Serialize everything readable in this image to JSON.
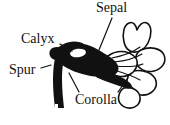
{
  "figure": {
    "kind": "botanical-line-drawing",
    "ink_color": "#111111",
    "background_color": "#ffffff",
    "labels": [
      {
        "id": "sepal",
        "text": "Sepal",
        "leader": "diagonal line down-left to sepal base"
      },
      {
        "id": "calyx",
        "text": "Calyx",
        "leader": "short line down-right to dark calyx mass"
      },
      {
        "id": "spur",
        "text": "Spur",
        "leader": "short line right to base of thick spur"
      },
      {
        "id": "corolla",
        "text": "Corolla",
        "leader": "two lines up-left and up-right to corolla lobes"
      }
    ]
  }
}
